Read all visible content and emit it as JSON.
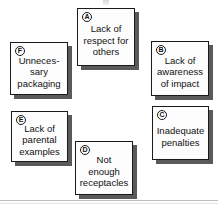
{
  "diagram": {
    "background_color": "#ffffff",
    "card_border_color": "#1a1a1a",
    "card_fill_color": "#fdfdfd",
    "shadow_color": "#5a5a5a",
    "cards": [
      {
        "id": "card-a",
        "badge": "A",
        "text": "Lack of\nrespect for\nothers",
        "x": 77,
        "y": 8,
        "width": 58,
        "height": 58,
        "text_offset": true
      },
      {
        "id": "card-b",
        "badge": "B",
        "text": "Lack of\nawareness\nof impact",
        "x": 151,
        "y": 41,
        "width": 58,
        "height": 55,
        "text_offset": true
      },
      {
        "id": "card-c",
        "badge": "C",
        "text": "Inadequate\npenalties",
        "x": 152,
        "y": 106,
        "width": 57,
        "height": 54,
        "text_offset": true
      },
      {
        "id": "card-d",
        "badge": "D",
        "text": "Not\nenough\nreceptacles",
        "x": 75,
        "y": 141,
        "width": 58,
        "height": 54,
        "text_offset": true
      },
      {
        "id": "card-e",
        "badge": "E",
        "text": "Lack of\nparental\nexamples",
        "x": 11,
        "y": 111,
        "width": 57,
        "height": 51,
        "text_offset": true
      },
      {
        "id": "card-f",
        "badge": "F",
        "text": "Unneces-\nsary\npackaging",
        "x": 10,
        "y": 42,
        "width": 58,
        "height": 53,
        "text_offset": true
      }
    ],
    "rule": {
      "label": "bottom-divider"
    }
  }
}
